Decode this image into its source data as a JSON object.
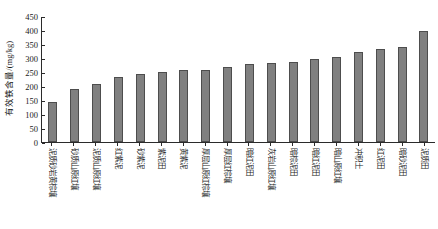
{
  "chart_data": {
    "type": "bar",
    "title": "",
    "xlabel": "",
    "ylabel": "有效铁含量/(mg/kg)",
    "ylim": [
      0,
      450
    ],
    "yticks": [
      0,
      50,
      100,
      150,
      200,
      250,
      300,
      350,
      400,
      450
    ],
    "grid": false,
    "legend": "none",
    "bar_color": "#808080",
    "bar_border_color": "#4d4d4d",
    "axis_color": "#2b2b2b",
    "categories": [
      "泥质砂岩黄棕壤",
      "砂质山原红壤",
      "泥质山原红壤",
      "红紫泥",
      "砂紫泥",
      "紫泥田",
      "黄紫泥",
      "厚层山原红棕壤",
      "厚层红棕壤",
      "暗红泥田",
      "灰岩山原红壤",
      "暗棕泥田",
      "暗红泥田",
      "暗山原红壤",
      "冲积土",
      "红泥田",
      "暗砂泥田",
      "泥质田"
    ],
    "values": [
      142,
      188,
      206,
      231,
      243,
      249,
      258,
      258,
      269,
      279,
      281,
      284,
      295,
      305,
      322,
      331,
      339,
      396
    ]
  }
}
